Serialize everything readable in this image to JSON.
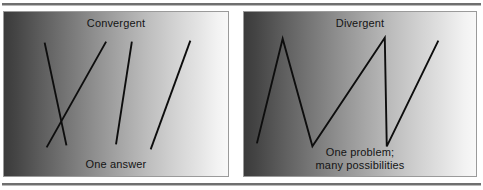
{
  "figure": {
    "name": "convergent-vs-divergent-thinking-diagram",
    "rules": {
      "top": "",
      "bottom": ""
    },
    "panels": [
      {
        "id": "convergent",
        "title": "Convergent",
        "footer": "One answer",
        "gradient_from": "#3b3b3b",
        "gradient_to": "#f8f8f8",
        "stroke_color": "#0d0d0d",
        "lines": [
          {
            "name": "line-1",
            "x1": 41,
            "y1": 31,
            "x2": 63,
            "y2": 135
          },
          {
            "name": "line-2",
            "x2": 43,
            "y2": 137,
            "x1": 103,
            "y1": 30
          },
          {
            "name": "line-3",
            "x1": 129,
            "y1": 30,
            "x2": 113,
            "y2": 134
          },
          {
            "name": "line-4",
            "x1": 188,
            "y1": 29,
            "x2": 148,
            "y2": 139
          }
        ]
      },
      {
        "id": "divergent",
        "title": "Divergent",
        "footer": "One problem;\nmany possibilities",
        "gradient_from": "#3b3b3b",
        "gradient_to": "#f8f8f8",
        "stroke_color": "#0d0d0d",
        "polyline": "13,133 39,27 69,136 142,26 144,136 196,29"
      }
    ]
  },
  "colors": {
    "rule": "#6f6f6f",
    "panel_border": "#9a9a9a",
    "text": "#141414",
    "stroke": "#0d0d0d"
  }
}
